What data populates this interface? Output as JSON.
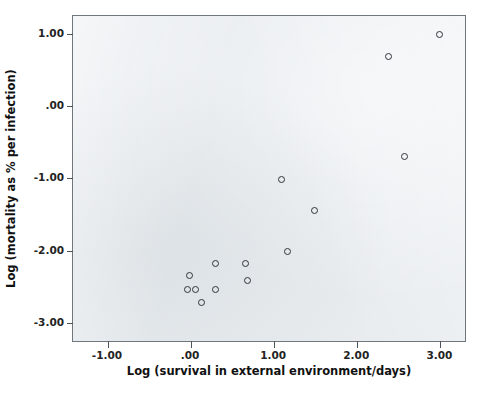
{
  "chart_data": {
    "type": "scatter",
    "title": "",
    "xlabel": "Log (survival in external environment/days)",
    "ylabel": "Log (mortality as % per infection)",
    "xlim": [
      -1.42,
      3.32
    ],
    "ylim": [
      -3.28,
      1.25
    ],
    "xticks": [
      -1.0,
      0.0,
      1.0,
      2.0,
      3.0
    ],
    "xticklabels": [
      "-1.00",
      ".00",
      "1.00",
      "2.00",
      "3.00"
    ],
    "yticks": [
      1.0,
      0.0,
      -1.0,
      -2.0,
      -3.0
    ],
    "yticklabels": [
      "1.00",
      ".00",
      "-1.00",
      "-2.00",
      "-3.00"
    ],
    "grid": false,
    "legend": null,
    "marker": "open-circle",
    "marker_color": "#2f3438",
    "panel_color": "#e8ecef",
    "frame_color": "#6f767c",
    "points": [
      {
        "x": 2.99,
        "y": 0.99
      },
      {
        "x": 2.38,
        "y": 0.69
      },
      {
        "x": 2.57,
        "y": -0.7
      },
      {
        "x": 1.09,
        "y": -1.01
      },
      {
        "x": 1.49,
        "y": -1.45
      },
      {
        "x": 1.16,
        "y": -2.01
      },
      {
        "x": 0.29,
        "y": -2.18
      },
      {
        "x": 0.65,
        "y": -2.18
      },
      {
        "x": -0.02,
        "y": -2.34
      },
      {
        "x": 0.68,
        "y": -2.42
      },
      {
        "x": -0.04,
        "y": -2.54
      },
      {
        "x": 0.05,
        "y": -2.54
      },
      {
        "x": 0.3,
        "y": -2.54
      },
      {
        "x": 0.13,
        "y": -2.72
      }
    ]
  },
  "caption": {
    "partial_line": ""
  }
}
